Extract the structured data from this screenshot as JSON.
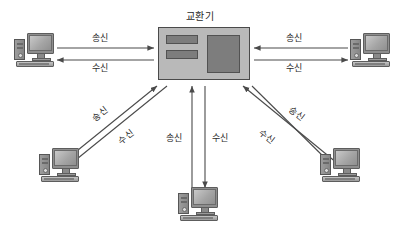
{
  "diagram": {
    "title": "교환기",
    "background_color": "#ffffff",
    "line_color": "#4a4a4a",
    "switch_fill": "#b9b9b9",
    "slot_fill": "#7d7d7d",
    "nodes": [
      {
        "id": "switch",
        "label": "교환기",
        "type": "switch"
      },
      {
        "id": "pc-top-left",
        "label": "",
        "type": "computer"
      },
      {
        "id": "pc-top-right",
        "label": "",
        "type": "computer"
      },
      {
        "id": "pc-bottom-left",
        "label": "",
        "type": "computer"
      },
      {
        "id": "pc-bottom",
        "label": "",
        "type": "computer"
      },
      {
        "id": "pc-bottom-right",
        "label": "",
        "type": "computer"
      }
    ],
    "links": [
      {
        "id": "left-send",
        "label": "송신",
        "direction": "to-switch"
      },
      {
        "id": "left-receive",
        "label": "수신",
        "direction": "from-switch"
      },
      {
        "id": "right-send",
        "label": "송신",
        "direction": "to-switch"
      },
      {
        "id": "right-receive",
        "label": "수신",
        "direction": "from-switch"
      },
      {
        "id": "lower-left-send",
        "label": "송신",
        "direction": "to-switch"
      },
      {
        "id": "lower-left-receive",
        "label": "수신",
        "direction": "from-switch"
      },
      {
        "id": "center-send",
        "label": "송신",
        "direction": "to-switch"
      },
      {
        "id": "center-receive",
        "label": "수신",
        "direction": "from-switch"
      },
      {
        "id": "lower-right-send",
        "label": "송신",
        "direction": "to-switch"
      },
      {
        "id": "lower-right-receive",
        "label": "수신",
        "direction": "from-switch"
      }
    ]
  }
}
